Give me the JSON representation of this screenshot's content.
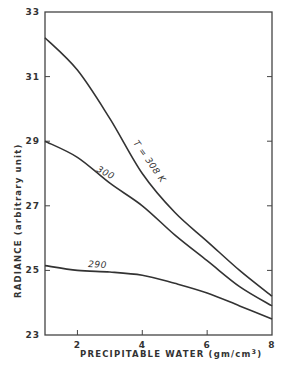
{
  "chart_data": {
    "type": "line",
    "title": "",
    "xlabel": "PRECIPITABLE WATER (gm/cm³)",
    "ylabel": "RADIANCE (arbitrary unit)",
    "xlim": [
      1,
      8
    ],
    "ylim": [
      23,
      33
    ],
    "xticks": [
      2,
      4,
      6,
      8
    ],
    "yticks": [
      23,
      25,
      27,
      29,
      31,
      33
    ],
    "grid": false,
    "legend": "none (inline curve labels)",
    "x": [
      1,
      2,
      3,
      4,
      5,
      6,
      7,
      8
    ],
    "series": [
      {
        "name": "T = 308 K",
        "label": "T = 308 K",
        "values": [
          32.2,
          31.2,
          29.7,
          28.0,
          26.8,
          25.9,
          25.0,
          24.2
        ]
      },
      {
        "name": "300",
        "label": "300",
        "values": [
          29.0,
          28.5,
          27.7,
          27.0,
          26.1,
          25.3,
          24.5,
          23.9
        ]
      },
      {
        "name": "290",
        "label": "290",
        "values": [
          25.15,
          25.0,
          24.95,
          24.85,
          24.6,
          24.3,
          23.9,
          23.5
        ]
      }
    ],
    "annotations": [
      "T = 308 K",
      "300",
      "290"
    ]
  },
  "labels": {
    "xlabel": "PRECIPITABLE WATER (gm/cm",
    "xlabel_sup": "3",
    "xlabel_end": ")",
    "ylabel": "RADIANCE (arbitrary unit)",
    "curve_308": "T = 308 K",
    "curve_300": "300",
    "curve_290": "290"
  }
}
